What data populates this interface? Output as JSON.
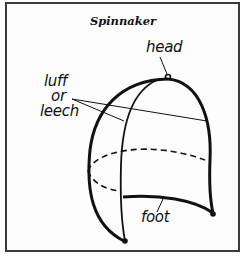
{
  "title": "Spinnaker",
  "labels": {
    "head": "head",
    "luff_line1": "luff",
    "luff_line2": "or",
    "luff_line3": "leech",
    "foot": "foot"
  },
  "colors": {
    "line": "#111111",
    "border": "#3a3a3a",
    "background": "#fdfdfd"
  }
}
